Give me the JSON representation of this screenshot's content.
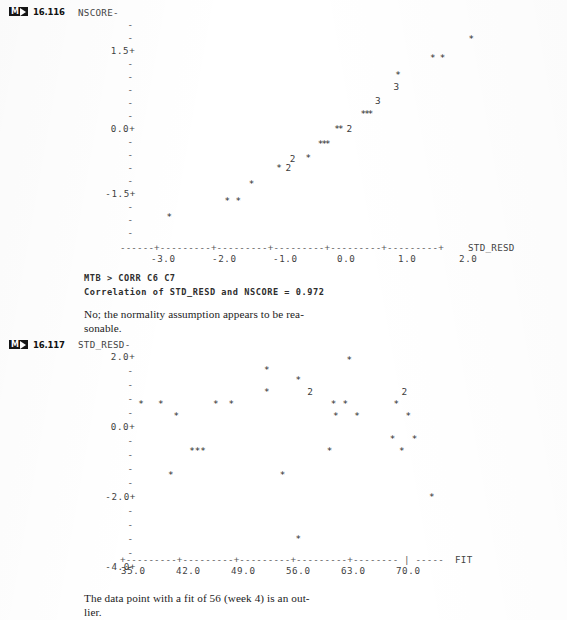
{
  "page": {
    "width": 567,
    "height": 620,
    "background": "#ffffff",
    "ink": "#2b2b2b"
  },
  "blocks": [
    {
      "badge_label": "M",
      "badge_icon": "play-triangle-icon",
      "number": "16.116"
    },
    {
      "badge_label": "M",
      "badge_icon": "play-triangle-icon",
      "number": "16.117"
    }
  ],
  "session": {
    "command_line": "MTB > CORR C6 C7",
    "output_line": "Correlation of STD_RESD and NSCORE = 0.972"
  },
  "answers": {
    "first": "No; the normality assumption appears to be rea-\nsonable.",
    "second": "The data point with a fit of 56 (week 4) is an out-\nlier."
  },
  "chart_data": [
    {
      "id": "normal-probability-plot",
      "type": "scatter",
      "title": "",
      "ylabel": "NSCORE",
      "xlabel": "STD_RESD",
      "ylim": [
        -2.25,
        2.25
      ],
      "xlim": [
        -3.5,
        2.5
      ],
      "grid": false,
      "legend": "none",
      "ytick_labels": [
        "1.5+",
        "0.0+",
        "-1.5+"
      ],
      "ytick_values": [
        1.5,
        0.0,
        -1.5
      ],
      "xtick_labels": [
        "-3.0",
        "-2.0",
        "-1.0",
        "0.0",
        "1.0",
        "2.0"
      ],
      "xtick_values": [
        -3.0,
        -2.0,
        -1.0,
        0.0,
        1.0,
        2.0
      ],
      "axis_line": "------+---------+---------+---------+---------+---------+",
      "axis_end_label": "STD_RESD",
      "points": [
        {
          "x": -2.9,
          "y": -1.85,
          "marker": "*",
          "count": 1
        },
        {
          "x": -1.95,
          "y": -1.5,
          "marker": "*",
          "count": 1
        },
        {
          "x": -1.77,
          "y": -1.5,
          "marker": "*",
          "count": 1
        },
        {
          "x": -1.55,
          "y": -1.15,
          "marker": "*",
          "count": 1
        },
        {
          "x": -1.1,
          "y": -0.82,
          "marker": "*",
          "count": 1
        },
        {
          "x": -0.95,
          "y": -0.82,
          "marker": "2",
          "count": 2
        },
        {
          "x": -0.88,
          "y": -0.62,
          "marker": "2",
          "count": 2
        },
        {
          "x": -0.62,
          "y": -0.6,
          "marker": "*",
          "count": 1
        },
        {
          "x": -0.42,
          "y": -0.3,
          "marker": "*",
          "count": 1
        },
        {
          "x": -0.36,
          "y": -0.3,
          "marker": "*",
          "count": 1
        },
        {
          "x": -0.3,
          "y": -0.3,
          "marker": "*",
          "count": 1
        },
        {
          "x": -0.15,
          "y": 0.0,
          "marker": "*",
          "count": 1
        },
        {
          "x": -0.09,
          "y": 0.0,
          "marker": "*",
          "count": 1
        },
        {
          "x": 0.05,
          "y": 0.0,
          "marker": "2",
          "count": 2
        },
        {
          "x": 0.28,
          "y": 0.32,
          "marker": "*",
          "count": 1
        },
        {
          "x": 0.34,
          "y": 0.32,
          "marker": "*",
          "count": 1
        },
        {
          "x": 0.4,
          "y": 0.32,
          "marker": "*",
          "count": 1
        },
        {
          "x": 0.52,
          "y": 0.6,
          "marker": "3",
          "count": 3
        },
        {
          "x": 0.82,
          "y": 0.9,
          "marker": "3",
          "count": 3
        },
        {
          "x": 0.85,
          "y": 1.15,
          "marker": "*",
          "count": 1
        },
        {
          "x": 1.42,
          "y": 1.5,
          "marker": "*",
          "count": 1
        },
        {
          "x": 1.58,
          "y": 1.5,
          "marker": "*",
          "count": 1
        },
        {
          "x": 2.05,
          "y": 1.9,
          "marker": "*",
          "count": 1
        }
      ]
    },
    {
      "id": "residual-versus-fit-plot",
      "type": "scatter",
      "title": "",
      "ylabel": "STD_RESD",
      "xlabel": "FIT",
      "ylim": [
        -4.6,
        2.6
      ],
      "xlim": [
        33.0,
        76.0
      ],
      "grid": false,
      "legend": "none",
      "ytick_labels": [
        "2.0+",
        "0.0+",
        "-2.0+",
        "-4.0+"
      ],
      "ytick_values": [
        2.0,
        0.0,
        -2.0,
        -4.0
      ],
      "xtick_labels": [
        "35.0",
        "42.0",
        "49.0",
        "56.0",
        "63.0",
        "70.0"
      ],
      "xtick_values": [
        35.0,
        42.0,
        49.0,
        56.0,
        63.0,
        70.0
      ],
      "axis_line": "+---------+---------+---------+---------+-------- | -----",
      "axis_end_label": "FIT",
      "points": [
        {
          "x": 62.5,
          "y": 2.0,
          "marker": "*",
          "count": 1
        },
        {
          "x": 52.0,
          "y": 1.7,
          "marker": "*",
          "count": 1
        },
        {
          "x": 56.0,
          "y": 1.4,
          "marker": "*",
          "count": 1
        },
        {
          "x": 52.0,
          "y": 1.05,
          "marker": "*",
          "count": 1
        },
        {
          "x": 57.5,
          "y": 1.05,
          "marker": "2",
          "count": 2
        },
        {
          "x": 69.5,
          "y": 1.05,
          "marker": "2",
          "count": 2
        },
        {
          "x": 36.0,
          "y": 0.7,
          "marker": "*",
          "count": 1
        },
        {
          "x": 38.5,
          "y": 0.7,
          "marker": "*",
          "count": 1
        },
        {
          "x": 45.5,
          "y": 0.7,
          "marker": "*",
          "count": 1
        },
        {
          "x": 47.5,
          "y": 0.7,
          "marker": "*",
          "count": 1
        },
        {
          "x": 60.5,
          "y": 0.7,
          "marker": "*",
          "count": 1
        },
        {
          "x": 62.0,
          "y": 0.7,
          "marker": "*",
          "count": 1
        },
        {
          "x": 68.5,
          "y": 0.7,
          "marker": "*",
          "count": 1
        },
        {
          "x": 40.5,
          "y": 0.35,
          "marker": "*",
          "count": 1
        },
        {
          "x": 60.8,
          "y": 0.35,
          "marker": "*",
          "count": 1
        },
        {
          "x": 63.5,
          "y": 0.35,
          "marker": "*",
          "count": 1
        },
        {
          "x": 70.0,
          "y": 0.35,
          "marker": "*",
          "count": 1
        },
        {
          "x": 68.0,
          "y": -0.35,
          "marker": "*",
          "count": 1
        },
        {
          "x": 70.8,
          "y": -0.35,
          "marker": "*",
          "count": 1
        },
        {
          "x": 42.5,
          "y": -0.7,
          "marker": "*",
          "count": 1
        },
        {
          "x": 43.2,
          "y": -0.7,
          "marker": "*",
          "count": 1
        },
        {
          "x": 43.9,
          "y": -0.7,
          "marker": "*",
          "count": 1
        },
        {
          "x": 60.0,
          "y": -0.7,
          "marker": "*",
          "count": 1
        },
        {
          "x": 69.2,
          "y": -0.7,
          "marker": "*",
          "count": 1
        },
        {
          "x": 39.8,
          "y": -1.4,
          "marker": "*",
          "count": 1
        },
        {
          "x": 54.0,
          "y": -1.4,
          "marker": "*",
          "count": 1
        },
        {
          "x": 73.0,
          "y": -2.05,
          "marker": "*",
          "count": 1
        },
        {
          "x": 56.0,
          "y": -3.3,
          "marker": "*",
          "count": 1
        }
      ]
    }
  ]
}
